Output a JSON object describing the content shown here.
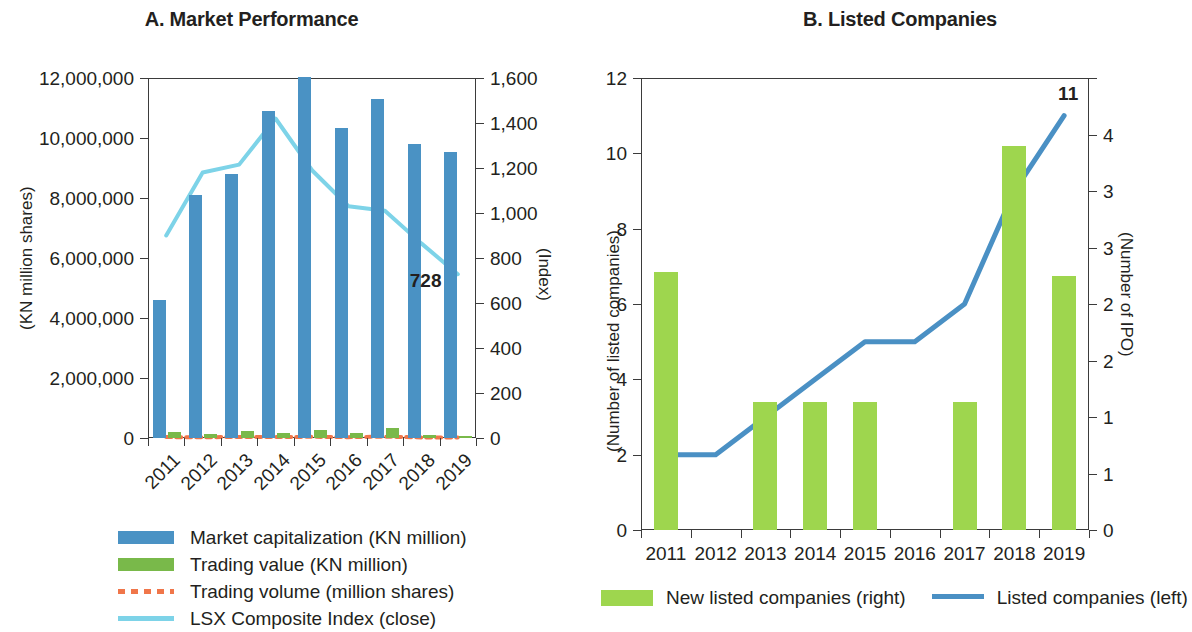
{
  "colors": {
    "market_cap_bar": "#4a92c4",
    "trading_value_bar": "#79b94a",
    "trading_volume_line": "#f0764a",
    "lsx_index_line": "#7dd3e8",
    "new_listed_bar": "#9ed64e",
    "listed_line": "#4a90c4",
    "axis": "#3b3b3b",
    "text": "#231f20"
  },
  "chart_data": [
    {
      "id": "panelA",
      "type": "bar",
      "title": "A. Market Performance",
      "xlabel": "",
      "ylabel": "(KN million shares)",
      "y2label": "(Index)",
      "categories": [
        "2011",
        "2012",
        "2013",
        "2014",
        "2015",
        "2016",
        "2017",
        "2018",
        "2019"
      ],
      "ylim": [
        0,
        12000000
      ],
      "yticks": [
        0,
        2000000,
        4000000,
        6000000,
        8000000,
        10000000,
        12000000
      ],
      "yticklabels": [
        "0",
        "2,000,000",
        "4,000,000",
        "6,000,000",
        "8,000,000",
        "10,000,000",
        "12,000,000"
      ],
      "y2lim": [
        0,
        1600
      ],
      "y2ticks": [
        0,
        200,
        400,
        600,
        800,
        1000,
        1200,
        1400,
        1600
      ],
      "y2ticklabels": [
        "0",
        "200",
        "400",
        "600",
        "800",
        "1,000",
        "1,200",
        "1,400",
        "1,600"
      ],
      "grid": false,
      "legend_position": "below",
      "series": [
        {
          "name": "Market capitalization (KN million)",
          "kind": "bar",
          "axis": "left",
          "color": "#4a92c4",
          "values": [
            4600000,
            8100000,
            8800000,
            10900000,
            12050000,
            10350000,
            11300000,
            9800000,
            9550000
          ]
        },
        {
          "name": "Trading value (KN million)",
          "kind": "bar",
          "axis": "left",
          "color": "#79b94a",
          "values": [
            210000,
            120000,
            230000,
            170000,
            270000,
            160000,
            330000,
            90000,
            70000
          ]
        },
        {
          "name": "Trading volume (million shares)",
          "kind": "dotted-line",
          "axis": "left",
          "color": "#f0764a",
          "values": [
            30000,
            25000,
            35000,
            30000,
            40000,
            28000,
            45000,
            20000,
            18000
          ]
        },
        {
          "name": "LSX Composite Index (close)",
          "kind": "line",
          "axis": "right",
          "color": "#7dd3e8",
          "values": [
            900,
            1180,
            1215,
            1420,
            1190,
            1030,
            1010,
            865,
            728
          ]
        }
      ],
      "annotations": [
        {
          "text": "728",
          "series": "LSX Composite Index (close)",
          "category": "2019",
          "value": 728
        }
      ]
    },
    {
      "id": "panelB",
      "type": "bar",
      "title": "B. Listed Companies",
      "xlabel": "",
      "ylabel": "(Number of listed companies)",
      "y2label": "(Number of IPO)",
      "categories": [
        "2011",
        "2012",
        "2013",
        "2014",
        "2015",
        "2016",
        "2017",
        "2018",
        "2019"
      ],
      "ylim": [
        0,
        12
      ],
      "yticks": [
        0,
        2,
        4,
        6,
        8,
        10,
        12
      ],
      "yticklabels": [
        "0",
        "2",
        "4",
        "6",
        "8",
        "10",
        "12"
      ],
      "y2lim": [
        0,
        4
      ],
      "y2ticks": [
        0,
        0.5,
        1,
        1.5,
        2,
        2.5,
        3,
        3.5,
        4
      ],
      "y2ticklabels": [
        "0",
        "1",
        "1",
        "2",
        "2",
        "3",
        "3",
        "4"
      ],
      "grid": false,
      "legend_position": "below",
      "series": [
        {
          "name": "New listed companies (right)",
          "kind": "bar",
          "axis": "right",
          "color": "#9ed64e",
          "values": [
            2.28,
            0,
            1.13,
            1.13,
            1.13,
            0,
            1.13,
            3.4,
            2.25
          ]
        },
        {
          "name": "Listed companies (left)",
          "kind": "line",
          "axis": "left",
          "color": "#4a90c4",
          "values": [
            2,
            2,
            3,
            4,
            5,
            5,
            6,
            9,
            11
          ]
        }
      ],
      "annotations": [
        {
          "text": "11",
          "series": "Listed companies (left)",
          "category": "2019",
          "value": 11
        }
      ]
    }
  ]
}
